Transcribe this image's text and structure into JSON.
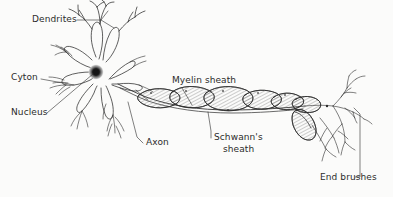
{
  "figure": {
    "style": "hand-drawn pen-and-ink line illustration",
    "background_color": "#fbfbfa",
    "ink_color": "#2b2b2b",
    "width": 393,
    "height": 197
  },
  "labels": {
    "dendrites": "Dendrites",
    "cyton": "Cyton",
    "nucleus": "Nucleus",
    "axon": "Axon",
    "myelin_sheath": "Myelin sheath",
    "schwanns_line1": "Schwann's",
    "schwanns_line2": "sheath",
    "end_brushes": "End brushes"
  },
  "parts": [
    {
      "id": "dendrites",
      "label": "Dendrites",
      "description": "branched fibrous projections extending from the cell body"
    },
    {
      "id": "cyton",
      "label": "Cyton",
      "description": "cell body of the neuron"
    },
    {
      "id": "nucleus",
      "label": "Nucleus",
      "description": "dark stippled nucleus at the center of the cyton"
    },
    {
      "id": "axon",
      "label": "Axon",
      "description": "long fiber carrying impulses away from the cell body"
    },
    {
      "id": "myelin-sheath",
      "label": "Myelin sheath",
      "description": "hatched insulating segments wrapping the axon"
    },
    {
      "id": "schwanns-sheath",
      "label": "Schwann's sheath",
      "description": "outer covering formed by Schwann cells"
    },
    {
      "id": "end-brushes",
      "label": "End brushes",
      "description": "fine terminal branches at the axon tip"
    }
  ]
}
